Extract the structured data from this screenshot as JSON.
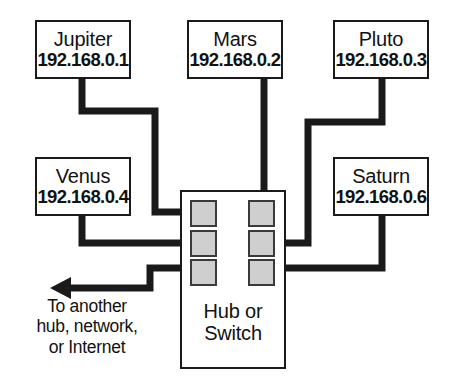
{
  "diagram": {
    "colors": {
      "line": "#1a1a1a",
      "box_border": "#1a1a1a",
      "box_fill": "#ffffff",
      "port_fill": "#cfcfcf",
      "port_border": "#3a3a3a",
      "text": "#121212",
      "background": "#ffffff"
    },
    "nodes": [
      {
        "id": "jupiter",
        "name": "Jupiter",
        "ip": "192.168.0.1"
      },
      {
        "id": "mars",
        "name": "Mars",
        "ip": "192.168.0.2"
      },
      {
        "id": "pluto",
        "name": "Pluto",
        "ip": "192.168.0.3"
      },
      {
        "id": "venus",
        "name": "Venus",
        "ip": "192.168.0.4"
      },
      {
        "id": "saturn",
        "name": "Saturn",
        "ip": "192.168.0.6"
      }
    ],
    "hub": {
      "label_line1": "Hub or",
      "label_line2": "Switch",
      "port_count": 6
    },
    "uplink": {
      "icon": "left-arrow-icon",
      "caption_line1": "To another",
      "caption_line2": "hub, network,",
      "caption_line3": "or Internet"
    }
  }
}
